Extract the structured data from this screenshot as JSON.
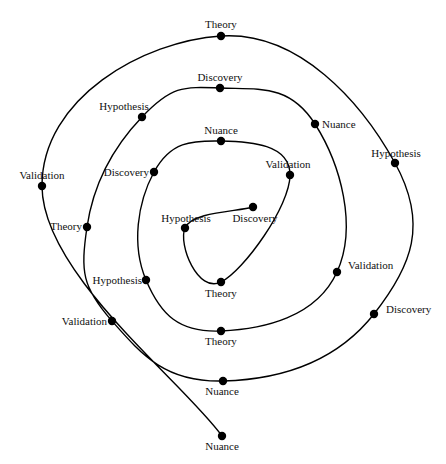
{
  "diagram": {
    "type": "spiral",
    "line_color": "#000000",
    "node_color": "#000000",
    "nodes": [
      {
        "label": "Discovery",
        "x": 253,
        "y": 207,
        "lx": 255,
        "ly": 222,
        "anchor": "middle"
      },
      {
        "label": "Hypothesis",
        "x": 185,
        "y": 228,
        "lx": 186,
        "ly": 222,
        "anchor": "middle"
      },
      {
        "label": "Theory",
        "x": 221,
        "y": 282,
        "lx": 221,
        "ly": 297,
        "anchor": "middle"
      },
      {
        "label": "Validation",
        "x": 290,
        "y": 175,
        "lx": 288,
        "ly": 168,
        "anchor": "middle"
      },
      {
        "label": "Nuance",
        "x": 221,
        "y": 141,
        "lx": 221,
        "ly": 134,
        "anchor": "middle"
      },
      {
        "label": "Discovery",
        "x": 154,
        "y": 172,
        "lx": 149,
        "ly": 176,
        "anchor": "end"
      },
      {
        "label": "Hypothesis",
        "x": 146,
        "y": 280,
        "lx": 142,
        "ly": 284,
        "anchor": "end"
      },
      {
        "label": "Theory",
        "x": 221,
        "y": 331,
        "lx": 221,
        "ly": 345,
        "anchor": "middle"
      },
      {
        "label": "Validation",
        "x": 337,
        "y": 272,
        "lx": 348,
        "ly": 269,
        "anchor": "start"
      },
      {
        "label": "Nuance",
        "x": 315,
        "y": 124,
        "lx": 322,
        "ly": 128,
        "anchor": "start"
      },
      {
        "label": "Discovery",
        "x": 220,
        "y": 88,
        "lx": 220,
        "ly": 81,
        "anchor": "middle"
      },
      {
        "label": "Hypothesis",
        "x": 142,
        "y": 117,
        "lx": 124,
        "ly": 110,
        "anchor": "middle"
      },
      {
        "label": "Theory",
        "x": 87,
        "y": 227,
        "lx": 82,
        "ly": 230,
        "anchor": "end"
      },
      {
        "label": "Validation",
        "x": 112,
        "y": 321,
        "lx": 107,
        "ly": 325,
        "anchor": "end"
      },
      {
        "label": "Nuance",
        "x": 223,
        "y": 381,
        "lx": 222,
        "ly": 395,
        "anchor": "middle"
      },
      {
        "label": "Discovery",
        "x": 374,
        "y": 314,
        "lx": 386,
        "ly": 313,
        "anchor": "start"
      },
      {
        "label": "Hypothesis",
        "x": 395,
        "y": 163,
        "lx": 396,
        "ly": 157,
        "anchor": "middle"
      },
      {
        "label": "Theory",
        "x": 221,
        "y": 36,
        "lx": 221,
        "ly": 28,
        "anchor": "middle"
      },
      {
        "label": "Validation",
        "x": 42,
        "y": 186,
        "lx": 42,
        "ly": 179,
        "anchor": "middle"
      },
      {
        "label": "Nuance",
        "x": 222,
        "y": 436,
        "lx": 222,
        "ly": 450,
        "anchor": "middle"
      }
    ]
  }
}
